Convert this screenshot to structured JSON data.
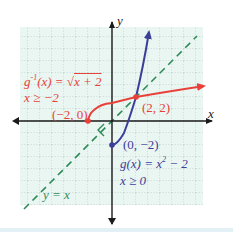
{
  "figure": {
    "axes": {
      "x_label": "x",
      "y_label": "y",
      "unit_px": 12,
      "origin_px": [
        112,
        121
      ],
      "grid": {
        "x_min": -7.7,
        "x_max": 7.6,
        "y_min": -7,
        "y_max": 7.7
      }
    },
    "colors": {
      "background": "#ffffff",
      "grid_fill": "#eaf6f1",
      "grid_lines": "#9cb8b0",
      "axis": "#1a1a1a",
      "inverse_function": "#e8413a",
      "function": "#3b3f9a",
      "identity_line": "#2f8a5a",
      "bottom_band": "#e3f1f6"
    },
    "labels": {
      "inverse_def_prefix": "g",
      "inverse_def_sup": "-1",
      "inverse_def_mid": "(x) = √",
      "inverse_def_radicand": "x + 2",
      "inverse_domain": "x ≥ −2",
      "func_def_prefix": "g(x) = x",
      "func_def_sup": "2",
      "func_def_suffix": " − 2",
      "func_domain": "x ≥ 0",
      "identity": "y = x",
      "point_inverse_start": "(−2, 0)",
      "point_intersection": "(2, 2)",
      "point_func_start": "(0, −2)"
    },
    "curves": [
      {
        "name": "g_inverse",
        "expr": "sqrt(x+2)",
        "domain": [
          -2,
          7.8
        ],
        "color_key": "inverse_function"
      },
      {
        "name": "g",
        "expr": "x^2-2",
        "domain": [
          0,
          3.1
        ],
        "color_key": "function"
      },
      {
        "name": "identity",
        "expr": "x",
        "domain": [
          -7.3,
          7.0
        ],
        "color_key": "identity_line",
        "dashed": true
      }
    ],
    "points": [
      {
        "x": -2,
        "y": 0,
        "color_key": "inverse_function"
      },
      {
        "x": 2,
        "y": 2,
        "color_key": "inverse_function"
      },
      {
        "x": 0,
        "y": -2,
        "color_key": "function"
      }
    ]
  }
}
